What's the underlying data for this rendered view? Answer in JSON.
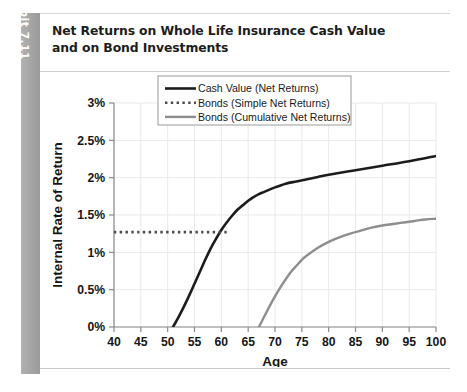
{
  "exhibit": {
    "label": "Exhibit 7.11"
  },
  "card": {
    "title": "Net Returns on Whole Life Insurance Cash Value and on Bond Investments"
  },
  "chart_data": {
    "type": "line",
    "title": "Net Returns on Whole Life Insurance Cash Value and on Bond Investments",
    "xlabel": "Age",
    "ylabel": "Internal Rate of Return",
    "xlim": [
      40,
      100
    ],
    "ylim": [
      0,
      3
    ],
    "grid": true,
    "legend_position": "top-center",
    "x_tick_labels": [
      "40",
      "45",
      "50",
      "55",
      "60",
      "65",
      "70",
      "75",
      "80",
      "85",
      "90",
      "95",
      "100"
    ],
    "x_ticks": [
      40,
      45,
      50,
      55,
      60,
      65,
      70,
      75,
      80,
      85,
      90,
      95,
      100
    ],
    "y_tick_labels": [
      "0%",
      "0.5%",
      "1%",
      "1.5%",
      "2%",
      "2.5%",
      "3%"
    ],
    "y_ticks": [
      0,
      0.5,
      1,
      1.5,
      2,
      2.5,
      3
    ],
    "series": [
      {
        "name": "Cash Value (Net Returns)",
        "color": "#1c1c1c",
        "style": "solid",
        "width": 2.6,
        "x": [
          51,
          52,
          53,
          54,
          55,
          56,
          57,
          58,
          59,
          60,
          61,
          62,
          63,
          64,
          65,
          66,
          67,
          68,
          70,
          72,
          74,
          76,
          78,
          80,
          85,
          90,
          95,
          100
        ],
        "y": [
          0.0,
          0.13,
          0.27,
          0.42,
          0.58,
          0.74,
          0.9,
          1.05,
          1.18,
          1.3,
          1.4,
          1.49,
          1.57,
          1.63,
          1.69,
          1.74,
          1.78,
          1.81,
          1.87,
          1.92,
          1.95,
          1.98,
          2.01,
          2.04,
          2.1,
          2.16,
          2.22,
          2.29
        ]
      },
      {
        "name": "Bonds (Simple Net Returns)",
        "color": "#4a4a4a",
        "style": "dotted",
        "width": 2.6,
        "x": [
          40,
          61
        ],
        "y": [
          1.27,
          1.27
        ]
      },
      {
        "name": "Bonds (Cumulative Net Returns)",
        "color": "#8e8e8e",
        "style": "solid",
        "width": 2.4,
        "x": [
          67,
          68,
          69,
          70,
          71,
          72,
          73,
          74,
          75,
          76,
          78,
          80,
          82,
          84,
          86,
          88,
          90,
          92,
          94,
          96,
          98,
          100
        ],
        "y": [
          0.0,
          0.14,
          0.28,
          0.41,
          0.53,
          0.64,
          0.74,
          0.82,
          0.9,
          0.96,
          1.06,
          1.14,
          1.2,
          1.25,
          1.29,
          1.33,
          1.36,
          1.38,
          1.4,
          1.42,
          1.44,
          1.45
        ]
      }
    ]
  }
}
